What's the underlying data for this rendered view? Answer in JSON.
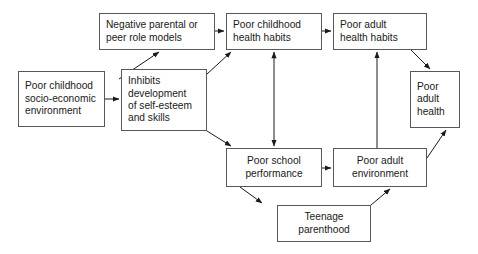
{
  "diagram": {
    "background_color": "#ffffff",
    "box_border_color": "#58585a",
    "text_color": "#1a1a1a",
    "arrow_color": "#1a1a1a",
    "nodes": [
      {
        "id": "poor-childhood-socio-economic-environment",
        "label": "Poor childhood\nsocio-economic\nenvironment",
        "x": 18,
        "y": 71,
        "w": 87,
        "h": 56,
        "align": "left"
      },
      {
        "id": "negative-parental-or-peer-role-models",
        "label": "Negative parental or\npeer role models",
        "x": 99,
        "y": 13,
        "w": 116,
        "h": 37,
        "align": "left"
      },
      {
        "id": "inhibits-development-of-self-esteem-and-skills",
        "label": "Inhibits\ndevelopment\nof self-esteem\nand skills",
        "x": 121,
        "y": 69,
        "w": 86,
        "h": 62,
        "align": "left"
      },
      {
        "id": "poor-childhood-health-habits",
        "label": "Poor childhood\nhealth habits",
        "x": 226,
        "y": 13,
        "w": 96,
        "h": 37,
        "align": "left"
      },
      {
        "id": "poor-adult-health-habits",
        "label": "Poor adult\nhealth habits",
        "x": 333,
        "y": 13,
        "w": 94,
        "h": 37,
        "align": "left"
      },
      {
        "id": "poor-adult-health",
        "label": "Poor\nadult\nhealth",
        "x": 410,
        "y": 71,
        "w": 50,
        "h": 57,
        "align": "left"
      },
      {
        "id": "poor-school-performance",
        "label": "Poor school\nperformance",
        "x": 226,
        "y": 148,
        "w": 96,
        "h": 39,
        "align": "center"
      },
      {
        "id": "poor-adult-environment",
        "label": "Poor adult\nenvironment",
        "x": 333,
        "y": 148,
        "w": 94,
        "h": 39,
        "align": "center"
      },
      {
        "id": "teenage-parenthood",
        "label": "Teenage\nparenthood",
        "x": 277,
        "y": 205,
        "w": 94,
        "h": 37,
        "align": "center"
      }
    ],
    "edges": [
      {
        "id": "env-to-inhibits",
        "from": "poor-childhood-socio-economic-environment",
        "to": "inhibits-development-of-self-esteem-and-skills",
        "points": "105,99 119,99"
      },
      {
        "id": "env-to-role-models",
        "from": "poor-childhood-socio-economic-environment",
        "to": "negative-parental-or-peer-role-models",
        "points": "119,79 159,52"
      },
      {
        "id": "role-models-to-child-habits",
        "from": "negative-parental-or-peer-role-models",
        "to": "poor-childhood-health-habits",
        "points": "215,31 224,31"
      },
      {
        "id": "inhibits-to-child-habits",
        "from": "inhibits-development-of-self-esteem-and-skills",
        "to": "poor-childhood-health-habits",
        "points": "207,74 231,52"
      },
      {
        "id": "inhibits-to-school",
        "from": "inhibits-development-of-self-esteem-and-skills",
        "to": "poor-school-performance",
        "points": "207,131 231,146"
      },
      {
        "id": "child-habits-to-adult-habits",
        "from": "poor-childhood-health-habits",
        "to": "poor-adult-health-habits",
        "points": "322,31 331,31"
      },
      {
        "id": "child-habits-school-double",
        "from": "poor-childhood-health-habits",
        "to": "poor-school-performance",
        "points": "274,52 274,146",
        "double": true
      },
      {
        "id": "school-to-adult-environment",
        "from": "poor-school-performance",
        "to": "poor-adult-environment",
        "points": "322,168 331,168"
      },
      {
        "id": "school-to-teenage",
        "from": "poor-school-performance",
        "to": "teenage-parenthood",
        "points": "240,187 262,203"
      },
      {
        "id": "teenage-to-adult-environment",
        "from": "teenage-parenthood",
        "to": "poor-adult-environment",
        "points": "371,205 390,189"
      },
      {
        "id": "adult-env-to-adult-habits",
        "from": "poor-adult-environment",
        "to": "poor-adult-health-habits",
        "points": "377,148 377,52"
      },
      {
        "id": "adult-habits-to-adult-health",
        "from": "poor-adult-health-habits",
        "to": "poor-adult-health",
        "points": "411,50 430,69"
      },
      {
        "id": "adult-env-to-adult-health",
        "from": "poor-adult-environment",
        "to": "poor-adult-health",
        "points": "427,158 446,130"
      }
    ]
  }
}
